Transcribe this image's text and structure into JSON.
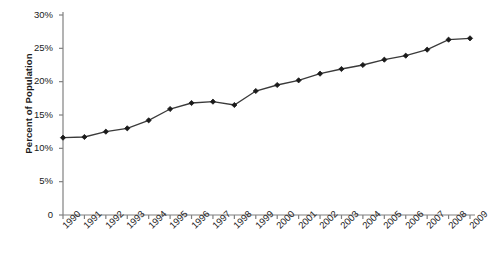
{
  "chart_data": {
    "type": "line",
    "title": "",
    "subtitle": "",
    "xlabel": "",
    "ylabel": "Percent of Population",
    "categories": [
      "1990",
      "1991",
      "1992",
      "1993",
      "1994",
      "1995",
      "1996",
      "1997",
      "1998",
      "1999",
      "2000",
      "2001",
      "2002",
      "2003",
      "2004",
      "2005",
      "2006",
      "2007",
      "2008",
      "2009"
    ],
    "values": [
      11.6,
      11.7,
      12.5,
      13.0,
      14.2,
      15.9,
      16.8,
      17.0,
      16.5,
      18.6,
      19.5,
      20.2,
      21.2,
      21.9,
      22.5,
      23.3,
      23.9,
      24.8,
      26.3,
      26.5
    ],
    "ylim": [
      0,
      30
    ],
    "ytick_labels": [
      "0",
      "5%",
      "10%",
      "15%",
      "20%",
      "25%",
      "30%"
    ],
    "ytick_values": [
      0,
      5,
      10,
      15,
      20,
      25,
      30
    ],
    "grid": false,
    "legend": null,
    "series": [
      {
        "name": "Percent of Population",
        "values": [
          11.6,
          11.7,
          12.5,
          13.0,
          14.2,
          15.9,
          16.8,
          17.0,
          16.5,
          18.6,
          19.5,
          20.2,
          21.2,
          21.9,
          22.5,
          23.3,
          23.9,
          24.8,
          26.3,
          26.5
        ],
        "color": "#333333",
        "marker": "diamond"
      }
    ],
    "line_color": "#3a3a3a",
    "marker_color": "#1a1a1a",
    "axis_color": "#808080"
  }
}
